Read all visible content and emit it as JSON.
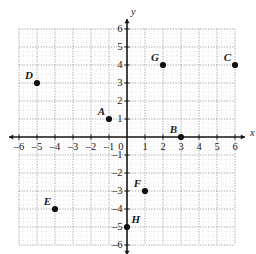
{
  "figure": {
    "type": "coordinate-plane",
    "axis_labels": {
      "x": "x",
      "y": "y"
    },
    "x_tick_labels": [
      "-6",
      "-5",
      "-4",
      "-3",
      "-2",
      "-1",
      "0",
      "1",
      "2",
      "3",
      "4",
      "5",
      "6"
    ],
    "y_tick_labels": [
      "6",
      "5",
      "4",
      "3",
      "2",
      "1",
      "-1",
      "-2",
      "-3",
      "-4",
      "-5",
      "-6"
    ],
    "origin_label": "0",
    "colors": {
      "axis": "#1a1a1a",
      "grid_major": "#8c8c8c",
      "grid_minor": "#c9c9c9",
      "point": "#111111",
      "text": "#1a1a1a",
      "background": "#ffffff"
    }
  },
  "chart_data": {
    "type": "scatter",
    "title": "",
    "xlabel": "x",
    "ylabel": "y",
    "xlim": [
      -6,
      6
    ],
    "ylim": [
      -6,
      6
    ],
    "xticks": [
      -6,
      -5,
      -4,
      -3,
      -2,
      -1,
      0,
      1,
      2,
      3,
      4,
      5,
      6
    ],
    "yticks": [
      -6,
      -5,
      -4,
      -3,
      -2,
      -1,
      0,
      1,
      2,
      3,
      4,
      5,
      6
    ],
    "grid": true,
    "grid_style": "dotted",
    "legend": false,
    "points": [
      {
        "label": "A",
        "x": -1,
        "y": 1,
        "label_pos": "upper-left"
      },
      {
        "label": "B",
        "x": 3,
        "y": 0,
        "label_pos": "upper-left"
      },
      {
        "label": "C",
        "x": 6,
        "y": 4,
        "label_pos": "upper-left"
      },
      {
        "label": "D",
        "x": -5,
        "y": 3,
        "label_pos": "upper-left"
      },
      {
        "label": "E",
        "x": -4,
        "y": -4,
        "label_pos": "upper-left"
      },
      {
        "label": "F",
        "x": 1,
        "y": -3,
        "label_pos": "upper-left"
      },
      {
        "label": "G",
        "x": 2,
        "y": 4,
        "label_pos": "upper-left"
      },
      {
        "label": "H",
        "x": 0,
        "y": -5,
        "label_pos": "upper-right"
      }
    ]
  }
}
